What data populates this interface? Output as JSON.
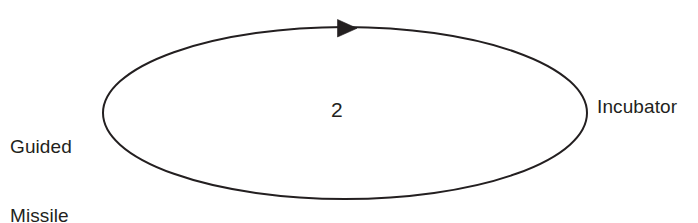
{
  "diagram": {
    "type": "causal-loop-diagram",
    "background_color": "#ffffff",
    "stroke_color": "#231f20",
    "text_color": "#231f20",
    "loop": {
      "shape": "ellipse",
      "center_x": 345,
      "center_y": 113,
      "radius_x": 242,
      "radius_y": 86,
      "stroke_width": 2,
      "direction": "clockwise",
      "number_label": "2"
    },
    "arrow": {
      "name": "clockwise-arrowhead",
      "position": "top-center",
      "tip_x": 355,
      "tip_y": 28,
      "points": "right",
      "fill": "#231f20"
    },
    "nodes": {
      "left": {
        "lines": [
          "Guided",
          "Missile"
        ],
        "line1": "Guided",
        "line2": "Missile"
      },
      "right": {
        "label": "Incubator"
      }
    }
  }
}
